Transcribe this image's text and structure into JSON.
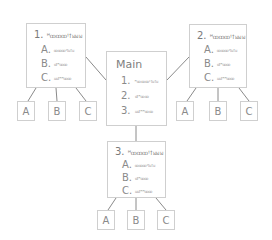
{
  "diagram": {
    "main": {
      "title": "Main",
      "items": [
        {
          "num": "1.",
          "text": "ꟸꝏꝏꝏꞋꝉꞟꝉꞟ"
        },
        {
          "num": "2.",
          "text": "ꭤꝉꟸꝏꝏ"
        },
        {
          "num": "3.",
          "text": "ꞟꞟꝉꟸꟸꝏꝏ"
        }
      ]
    },
    "sections": [
      {
        "num": "1.",
        "title": "ꟸꝏꝏꝏꞋꝉꞟꞟꞟ",
        "items": [
          {
            "letter": "A.",
            "text": "ꝏꝏꝏꞋꝉꞟꝉꞟ"
          },
          {
            "letter": "B.",
            "text": "ꭤꝉꟸꝏꝏ"
          },
          {
            "letter": "C.",
            "text": "ꞟꞟꝉꟸꟸꝏꝏ"
          }
        ],
        "children": [
          "A",
          "B",
          "C"
        ]
      },
      {
        "num": "2.",
        "title": "ꟸꝏꝏꝏꞋꝉꞟꞟꞟ",
        "items": [
          {
            "letter": "A.",
            "text": "ꝏꝏꝏꞋꝉꞟꝉꞟ"
          },
          {
            "letter": "B.",
            "text": "ꭤꝉꟸꝏꝏ"
          },
          {
            "letter": "C.",
            "text": "ꞟꞟꝉꟸꟸꝏꝏ"
          }
        ],
        "children": [
          "A",
          "B",
          "C"
        ]
      },
      {
        "num": "3.",
        "title": "ꟸꝏꝏꝏꞋꝉꞟꞟꞟ",
        "items": [
          {
            "letter": "A.",
            "text": "ꝏꝏꝏꞋꝉꞟꝉꞟ"
          },
          {
            "letter": "B.",
            "text": "ꭤꝉꟸꝏꝏ"
          },
          {
            "letter": "C.",
            "text": "ꞟꞟꝉꟸꟸꝏꝏ"
          }
        ],
        "children": [
          "A",
          "B",
          "C"
        ]
      }
    ],
    "colors": {
      "border": "#cfcfcf",
      "line": "#8a8a8a",
      "text": "#8a8a8a",
      "background": "#ffffff"
    }
  }
}
